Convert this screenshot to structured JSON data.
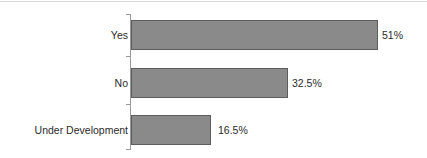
{
  "chart_data": {
    "type": "bar",
    "orientation": "horizontal",
    "title": "",
    "subtitle": "",
    "xlabel": "",
    "ylabel": "",
    "categories": [
      "Yes",
      "No",
      "Under Development"
    ],
    "values": [
      51,
      32.5,
      16.5
    ],
    "value_labels": [
      "51%",
      "32.5%",
      "16.5%"
    ],
    "xlim": [
      0,
      55
    ],
    "grid": false,
    "legend": false,
    "legend_position": "none",
    "series": [
      {
        "name": "Percent of respondents",
        "values": [
          51,
          32.5,
          16.5
        ]
      }
    ],
    "colors": {
      "bar_fill": "#8a8a8a",
      "bar_border": "#5d5d5d",
      "axis": "#9a9a9c",
      "text": "#2b2b2b",
      "background": "#ffffff"
    }
  },
  "bars": [
    {
      "category": "Yes",
      "value": 51,
      "value_label": "51%",
      "top": 20,
      "width": 247,
      "label_left": 382
    },
    {
      "category": "No",
      "value": 32.5,
      "value_label": "32.5%",
      "top": 68,
      "width": 157,
      "label_left": 292
    },
    {
      "category": "Under Development",
      "value": 16.5,
      "value_label": "16.5%",
      "top": 115,
      "width": 82,
      "label_left": 218
    }
  ],
  "axis": {
    "ticks": [
      {
        "top": 14
      },
      {
        "top": 56
      },
      {
        "top": 104
      },
      {
        "top": 149
      }
    ]
  }
}
